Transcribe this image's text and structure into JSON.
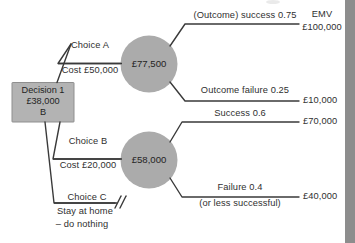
{
  "diagram": {
    "colors": {
      "node_fill": "#ababab",
      "box_fill": "#b3b3b3",
      "box_stroke": "#8f8f8f",
      "line": "#3a3a3a",
      "text": "#2f2f2f",
      "edge_bar": "#8d8d8d"
    },
    "decision_node": {
      "label": "Decision 1",
      "value": "£38,000",
      "choice": "B"
    },
    "chance_nodes": [
      {
        "id": "chance-a",
        "value": "£77,500"
      },
      {
        "id": "chance-b",
        "value": "£58,000"
      }
    ],
    "branches": [
      {
        "id": "choice-a",
        "name": "Choice A",
        "cost": "Cost £50,000"
      },
      {
        "id": "choice-b",
        "name": "Choice B",
        "cost": "Cost £20,000"
      },
      {
        "id": "choice-c",
        "name": "Choice C",
        "line1": "Stay at home",
        "line2": "– do nothing",
        "pruned": "//"
      }
    ],
    "outcomes": [
      {
        "id": "outcome-a-success",
        "label": "(Outcome) success 0.75",
        "sublabel": "",
        "payoff": "£100,000"
      },
      {
        "id": "outcome-a-failure",
        "label": "Outcome failure 0.25",
        "sublabel": "",
        "payoff": "£10,000"
      },
      {
        "id": "outcome-b-success",
        "label": "Success 0.6",
        "sublabel": "",
        "payoff": "£70,000"
      },
      {
        "id": "outcome-b-failure",
        "label": "Failure 0.4",
        "sublabel": "(or less successful)",
        "payoff": "£40,000"
      }
    ],
    "header": {
      "emv_label": "EMV"
    }
  }
}
